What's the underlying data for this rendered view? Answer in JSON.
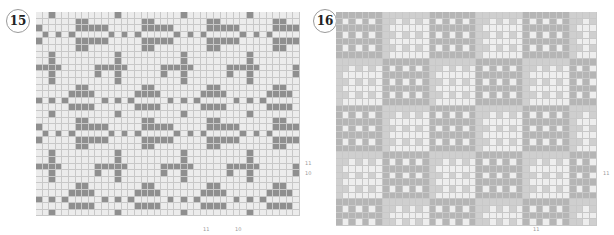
{
  "panels": [
    {
      "number": "15",
      "colors": {
        "dark": "#8f8f8f",
        "light": "#ececec"
      },
      "cols": 40,
      "rows": 31,
      "bottom_labels": [
        "11",
        "10"
      ],
      "side_labels": [
        "11",
        "10"
      ]
    },
    {
      "number": "16",
      "colors": {
        "dark": "#b5b5b5",
        "mid": "#cfcfcf",
        "light": "#eeeeee"
      },
      "cols": 39,
      "rows": 32,
      "bottom_labels": [
        "11"
      ],
      "side_labels": [
        "11"
      ]
    }
  ]
}
